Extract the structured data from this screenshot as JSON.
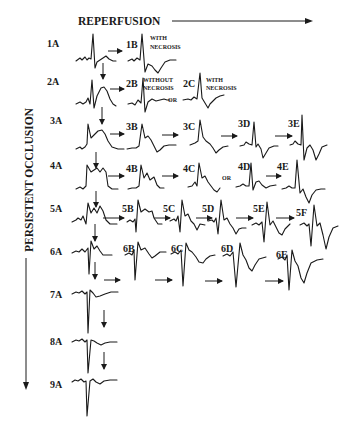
{
  "header": {
    "reperfusion_label": "REPERFUSION"
  },
  "side": {
    "occlusion_label": "PERSISTENT OCCLUSION"
  },
  "colors": {
    "background": "#ffffff",
    "ink": "#1a1a1a"
  },
  "rows": [
    {
      "id": "1",
      "labels": [
        "1A",
        "1B"
      ],
      "notes": {
        "1B": "WITH NECROSIS"
      }
    },
    {
      "id": "2",
      "labels": [
        "2A",
        "2B",
        "2C"
      ],
      "notes": {
        "2B": "WITHOUT NECROSIS",
        "2C": "WITH NECROSIS"
      },
      "or": "OR"
    },
    {
      "id": "3",
      "labels": [
        "3A",
        "3B",
        "3C",
        "3D",
        "3E"
      ]
    },
    {
      "id": "4",
      "labels": [
        "4A",
        "4B",
        "4C",
        "4D",
        "4E"
      ],
      "or": "OR"
    },
    {
      "id": "5",
      "labels": [
        "5A",
        "5B",
        "5C",
        "5D",
        "5E",
        "5F"
      ]
    },
    {
      "id": "6",
      "labels": [
        "6A",
        "6B",
        "6C",
        "6D",
        "6E"
      ]
    },
    {
      "id": "7",
      "labels": [
        "7A"
      ]
    },
    {
      "id": "8",
      "labels": [
        "8A"
      ]
    },
    {
      "id": "9",
      "labels": [
        "9A"
      ]
    }
  ],
  "notes": {
    "with": "WITH",
    "necrosis": "NECROSIS",
    "without": "WITHOUT",
    "or": "OR"
  }
}
